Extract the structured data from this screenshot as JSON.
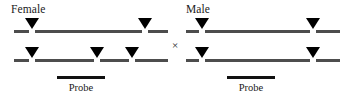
{
  "figure": {
    "type": "genetic-cross-diagram",
    "background_color": "#ffffff",
    "line_color": "#4d4d4d",
    "marker_color": "#000000",
    "cross_symbol": "×"
  },
  "female": {
    "label": "Female",
    "probe_label": "Probe",
    "chromosomes": [
      {
        "name": "female-chromosome-top",
        "marker_count": 2
      },
      {
        "name": "female-chromosome-bottom",
        "marker_count": 3
      }
    ]
  },
  "male": {
    "label": "Male",
    "probe_label": "Probe",
    "chromosomes": [
      {
        "name": "male-chromosome-top",
        "marker_count": 2
      },
      {
        "name": "male-chromosome-bottom",
        "marker_count": 2
      }
    ]
  }
}
